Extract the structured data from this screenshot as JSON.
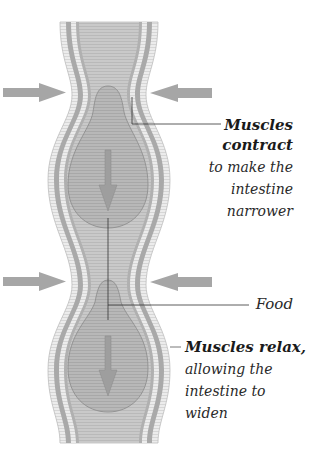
{
  "diagram": {
    "colors": {
      "background": "#ffffff",
      "outer_wall": "#dcdcdc",
      "wall_stripe": "#a9a9a9",
      "wall_light": "#efefef",
      "lumen": "#c4c4c4",
      "food": "#b3b3b3",
      "food_outline": "#8f8f8f",
      "arrow": "#a6a6a6",
      "leader_line": "#333333",
      "text": "#2a2a2a"
    },
    "labels": {
      "contract": {
        "heading_line1": "Muscles",
        "heading_line2": "contract",
        "body_line1": "to make the",
        "body_line2": "intestine",
        "body_line3": "narrower"
      },
      "food": {
        "text": "Food"
      },
      "relax": {
        "heading": "Muscles relax,",
        "body_line1": "allowing the",
        "body_line2": "intestine to",
        "body_line3": "widen"
      }
    },
    "arrows": [
      {
        "name": "squeeze-arrow-left-upper",
        "direction": "right"
      },
      {
        "name": "squeeze-arrow-right-upper",
        "direction": "left"
      },
      {
        "name": "squeeze-arrow-left-lower",
        "direction": "right"
      },
      {
        "name": "squeeze-arrow-right-lower",
        "direction": "left"
      },
      {
        "name": "food-movement-arrow-upper",
        "direction": "down"
      },
      {
        "name": "food-movement-arrow-lower",
        "direction": "down"
      }
    ]
  }
}
